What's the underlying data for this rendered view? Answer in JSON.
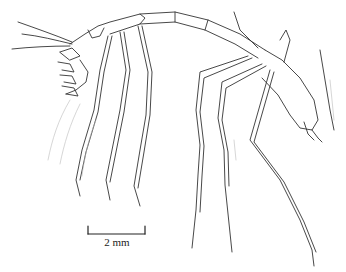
{
  "figure": {
    "scale_bar": {
      "label": "2 mm"
    }
  },
  "colors": {
    "background": "#ffffff",
    "ink": "#333333"
  }
}
